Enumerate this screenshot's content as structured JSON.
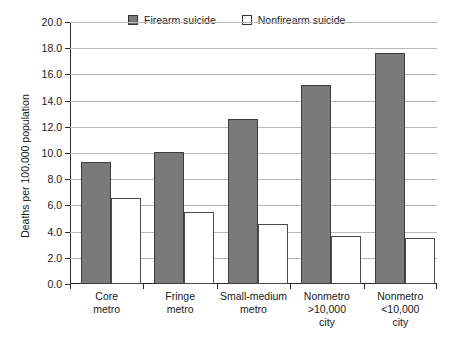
{
  "chart_data": {
    "type": "bar",
    "title": "",
    "subtitle": "",
    "xlabel": "",
    "ylabel": "Deaths per 100,000 population",
    "ylim": [
      0.0,
      20.0
    ],
    "ytick_step": 2.0,
    "ytick_labels": [
      "0.0",
      "2.0",
      "4.0",
      "6.0",
      "8.0",
      "10.0",
      "12.0",
      "14.0",
      "16.0",
      "18.0",
      "20.0"
    ],
    "ytick_values": [
      0.0,
      2.0,
      4.0,
      6.0,
      8.0,
      10.0,
      12.0,
      14.0,
      16.0,
      18.0,
      20.0
    ],
    "grid": true,
    "grid_axis": "y",
    "legend_position": "top-center",
    "categories": [
      {
        "lines": [
          "Core",
          "metro"
        ]
      },
      {
        "lines": [
          "Fringe",
          "metro"
        ]
      },
      {
        "lines": [
          "Small-medium",
          "metro"
        ]
      },
      {
        "lines": [
          "Nonmetro",
          ">10,000",
          "city"
        ]
      },
      {
        "lines": [
          "Nonmetro",
          "<10,000",
          "city"
        ]
      }
    ],
    "category_labels": [
      "Core metro",
      "Fringe metro",
      "Small-medium metro",
      "Nonmetro >10,000 city",
      "Nonmetro <10,000 city"
    ],
    "series": [
      {
        "name": "Firearm suicide",
        "style": "filled",
        "color": "#7a7a7a",
        "edge_color": "#3d3d3d",
        "values": [
          9.3,
          10.1,
          12.6,
          15.2,
          17.6
        ]
      },
      {
        "name": "Nonfirearm suicide",
        "style": "hollow",
        "color": "#ffffff",
        "edge_color": "#4a4a4a",
        "values": [
          6.6,
          5.5,
          4.6,
          3.7,
          3.5
        ]
      }
    ]
  },
  "legend": {
    "entries": [
      {
        "label": "Firearm suicide",
        "swatch": "filled-square-swatch"
      },
      {
        "label": "Nonfirearm suicide",
        "swatch": "hollow-square-swatch"
      }
    ]
  },
  "colors": {
    "firearm_fill": "#7a7a7a",
    "nonfirearm_fill": "#ffffff",
    "axis": "#2b2b2b",
    "gridline": "#b9b9b9",
    "background": "#ffffff"
  }
}
